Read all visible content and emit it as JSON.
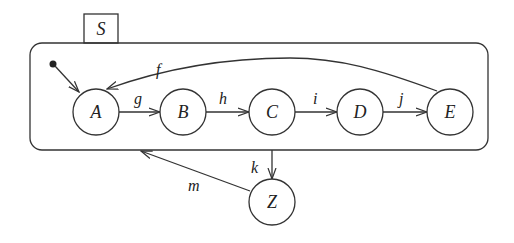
{
  "diagram": {
    "type": "statechart",
    "superstate": {
      "label": "S"
    },
    "states": [
      {
        "id": "A",
        "label": "A",
        "cx": 96,
        "cy": 112
      },
      {
        "id": "B",
        "label": "B",
        "cx": 183,
        "cy": 112
      },
      {
        "id": "C",
        "label": "C",
        "cx": 272,
        "cy": 112
      },
      {
        "id": "D",
        "label": "D",
        "cx": 360,
        "cy": 112
      },
      {
        "id": "E",
        "label": "E",
        "cx": 450,
        "cy": 112
      },
      {
        "id": "Z",
        "label": "Z",
        "cx": 272,
        "cy": 202
      }
    ],
    "transitions": [
      {
        "from": "initial",
        "to": "A",
        "label": ""
      },
      {
        "from": "A",
        "to": "B",
        "label": "g"
      },
      {
        "from": "B",
        "to": "C",
        "label": "h"
      },
      {
        "from": "C",
        "to": "D",
        "label": "i"
      },
      {
        "from": "D",
        "to": "E",
        "label": "j"
      },
      {
        "from": "E",
        "to": "A",
        "label": "f"
      },
      {
        "from": "C",
        "to": "Z",
        "label": "k"
      },
      {
        "from": "Z",
        "to": "S",
        "label": "m"
      }
    ],
    "colors": {
      "stroke": "#333333",
      "background": "#ffffff"
    }
  }
}
